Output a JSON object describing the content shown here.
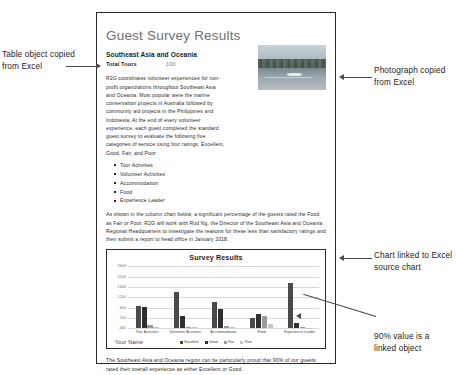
{
  "document": {
    "title": "Guest Survey Results",
    "subheading": "Southeast Asia and Oceania",
    "table": {
      "label": "Total Tours",
      "value": "100"
    },
    "paragraph_1": "R2G coordinates volunteer experiences for non-profit organizations throughout Southeast Asia and Oceania. Most popular were the marine conservation projects in Australia followed by community aid projects in the Philippines and Indonesia. At the end of every volunteer experience, each guest completed the standard guest survey to evaluate the following five categories of service using four ratings: Excellent, Good, Fair, and Poor:",
    "bullets": [
      "Tour Activities",
      "Volunteer Activities",
      "Accommodation",
      "Food",
      "Experience Leader"
    ],
    "paragraph_2": "As shown in the column chart below, a significant percentage of the guests rated the Food as Fair or Poor. R2G will work with Rod Ng, the Director of the Southeast Asia and Oceania Regional Headquarters to investigate the reasons for these less than satisfactory ratings and then submit a report to head office in January 2018.",
    "paragraph_3": "The Southeast Asia and Oceania region can be particularly proud that 90% of our guests rated their overall experience as either Excellent or Good.",
    "footer_name": "Your Name"
  },
  "photo": {
    "alt": "Lake and tree line photograph"
  },
  "callouts": {
    "table": "Table object copied from Excel",
    "photo": "Photograph copied from Excel",
    "chart": "Chart linked to Excel source chart",
    "value": "90% value is a linked object"
  },
  "chart_data": {
    "type": "bar",
    "title": "Survey Results",
    "xlabel": "",
    "ylabel": "",
    "categories": [
      "Tour Activities",
      "Volunteer Activities",
      "Accommodation",
      "Food",
      "Experience Leader"
    ],
    "series": [
      {
        "name": "Excellent",
        "color": "#4a4a4a",
        "values": [
          1100,
          1750,
          1300,
          500,
          2200
        ]
      },
      {
        "name": "Good",
        "color": "#2f2f2f",
        "values": [
          1050,
          600,
          950,
          700,
          250
        ]
      },
      {
        "name": "Fair",
        "color": "#9a9a9a",
        "values": [
          140,
          90,
          130,
          620,
          60
        ]
      },
      {
        "name": "Poor",
        "color": "#c4c4c4",
        "values": [
          90,
          60,
          80,
          230,
          40
        ]
      }
    ],
    "yticks": [
      2600,
      2100,
      1600,
      1100,
      600,
      100,
      -400
    ],
    "ylim": [
      -400,
      2600
    ],
    "grid": true,
    "legend_position": "bottom"
  }
}
